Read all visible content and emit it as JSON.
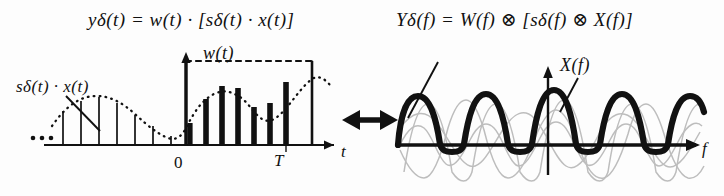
{
  "figure": {
    "title_alt": "Windowed sampled signal and its spectrum",
    "background": "#fdfdfd",
    "ink": "#111111",
    "faint_ink": "#b9b9b9",
    "width": 724,
    "height": 196
  },
  "equations": {
    "time_domain": "yδ(t) = w(t) · [sδ(t) · x(t)]",
    "freq_domain": "Yδ(f) = W(f) ⊗ [sδ(f) ⊗ X(f)]"
  },
  "left_panel": {
    "curve_label": "sδ(t) · x(t)",
    "window_label": "w(t)",
    "x_axis_label": "t",
    "origin_label": "0",
    "window_end_label": "T",
    "ellipsis": "• • •",
    "description": "Impulse train samples of x(t); thin stems left of 0, thick stems between 0 and T under a dotted envelope",
    "dotted_envelope": "x(t) envelope",
    "stems_thin": [
      {
        "x": 60,
        "h": 36
      },
      {
        "x": 78,
        "h": 44
      },
      {
        "x": 96,
        "h": 47
      },
      {
        "x": 114,
        "h": 42
      },
      {
        "x": 132,
        "h": 31
      },
      {
        "x": 150,
        "h": 22
      },
      {
        "x": 168,
        "h": 17
      }
    ],
    "stems_thick": [
      {
        "x": 186,
        "h": 24
      },
      {
        "x": 204,
        "h": 48
      },
      {
        "x": 222,
        "h": 62
      },
      {
        "x": 240,
        "h": 60
      },
      {
        "x": 258,
        "h": 44
      },
      {
        "x": 276,
        "h": 48
      },
      {
        "x": 294,
        "h": 66
      }
    ],
    "window_stems": [
      {
        "x": 186,
        "h": 84
      },
      {
        "x": 312,
        "h": 84
      }
    ]
  },
  "right_panel": {
    "spectrum_label": "X(f)",
    "x_axis_label": "f",
    "description": "Periodic replicas of the spectrum; bold curve is Yδ(f), faint curves are shifted copies of W(f)⊗X(f)",
    "replica_centers": [
      -2,
      -1,
      0,
      1,
      2
    ],
    "bold_series_name": "Yδ(f)",
    "faint_series_name": "shifted W(f) replicas"
  },
  "connector": {
    "symbol": "double-headed-arrow",
    "meaning": "Fourier transform pair"
  }
}
